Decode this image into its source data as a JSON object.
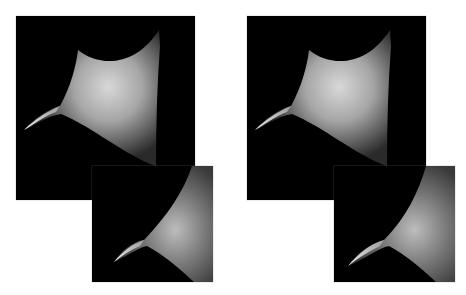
{
  "figure": {
    "background": "#ffffff",
    "panel_background": "#000000",
    "groups": [
      {
        "id": "left",
        "large": {
          "label": "left-large-render"
        },
        "small": {
          "label": "left-small-render"
        }
      },
      {
        "id": "right",
        "large": {
          "label": "right-large-render"
        },
        "small": {
          "label": "right-small-render"
        }
      }
    ]
  }
}
